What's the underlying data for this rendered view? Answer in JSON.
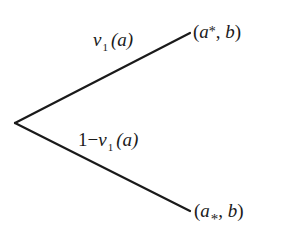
{
  "diagram": {
    "type": "probability-tree",
    "root": {
      "x": 15,
      "y": 123
    },
    "line_color": "#1a1a1a",
    "branches": [
      {
        "id": "upper",
        "end": {
          "x": 190,
          "y": 33
        },
        "probability_label": {
          "symbol": "ν",
          "subscript": "1",
          "argument": "(a)",
          "text": "ν₁(a)"
        },
        "outcome_label": {
          "open": "(",
          "var": "a",
          "marker": "*",
          "rest_comma": ",",
          "rest_b": "b",
          "close": ")",
          "text": "(a*, b)"
        }
      },
      {
        "id": "lower",
        "end": {
          "x": 190,
          "y": 211
        },
        "probability_label": {
          "prefix": "1−",
          "symbol": "ν",
          "subscript": "1",
          "argument": "(a)",
          "text": "1−ν₁(a)"
        },
        "outcome_label": {
          "open": "(",
          "var": "a",
          "marker": "*",
          "rest_comma": ",",
          "rest_b": "b",
          "close": ")",
          "text": "(a₊, b)"
        }
      }
    ]
  }
}
